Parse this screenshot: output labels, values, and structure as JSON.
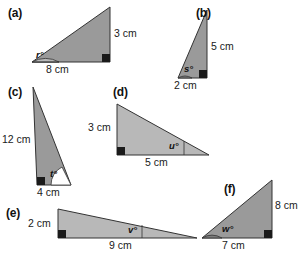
{
  "colors": {
    "triangle_fill": "#9a9a9a",
    "triangle_fill_light": "#b8b8b8",
    "triangle_stroke": "#333333",
    "angle_arc_fill": "#ffffff",
    "angle_arc_fill_dark": "#7d7d7d",
    "right_angle_marker": "#1a1a1a",
    "text": "#1a1a1a",
    "background": "#ffffff"
  },
  "figure": {
    "type": "geometry-diagram",
    "panels": [
      {
        "id": "a",
        "letter": "(a)",
        "unknown_angle": "r°",
        "sides": [
          {
            "label": "3 cm",
            "value": 3,
            "unit": "cm",
            "position": "right"
          },
          {
            "label": "8 cm",
            "value": 8,
            "unit": "cm",
            "position": "bottom"
          }
        ],
        "right_angle_corner": "bottom-right",
        "unknown_angle_corner": "bottom-left"
      },
      {
        "id": "b",
        "letter": "(b)",
        "unknown_angle": "s°",
        "sides": [
          {
            "label": "5 cm",
            "value": 5,
            "unit": "cm",
            "position": "right"
          },
          {
            "label": "2 cm",
            "value": 2,
            "unit": "cm",
            "position": "bottom"
          }
        ],
        "right_angle_corner": "bottom-right",
        "unknown_angle_corner": "bottom-left"
      },
      {
        "id": "c",
        "letter": "(c)",
        "unknown_angle": "t°",
        "sides": [
          {
            "label": "12 cm",
            "value": 12,
            "unit": "cm",
            "position": "left"
          },
          {
            "label": "4 cm",
            "value": 4,
            "unit": "cm",
            "position": "bottom"
          }
        ],
        "right_angle_corner": "bottom-left",
        "unknown_angle_corner": "bottom-right"
      },
      {
        "id": "d",
        "letter": "(d)",
        "unknown_angle": "u°",
        "sides": [
          {
            "label": "3 cm",
            "value": 3,
            "unit": "cm",
            "position": "left"
          },
          {
            "label": "5 cm",
            "value": 5,
            "unit": "cm",
            "position": "bottom"
          }
        ],
        "right_angle_corner": "bottom-left",
        "unknown_angle_corner": "bottom-right"
      },
      {
        "id": "e",
        "letter": "(e)",
        "unknown_angle": "v°",
        "sides": [
          {
            "label": "2 cm",
            "value": 2,
            "unit": "cm",
            "position": "left"
          },
          {
            "label": "9 cm",
            "value": 9,
            "unit": "cm",
            "position": "bottom"
          }
        ],
        "right_angle_corner": "bottom-left",
        "unknown_angle_corner": "bottom-right"
      },
      {
        "id": "f",
        "letter": "(f)",
        "unknown_angle": "w°",
        "sides": [
          {
            "label": "8 cm",
            "value": 8,
            "unit": "cm",
            "position": "right"
          },
          {
            "label": "7 cm",
            "value": 7,
            "unit": "cm",
            "position": "bottom"
          }
        ],
        "right_angle_corner": "bottom-right",
        "unknown_angle_corner": "bottom-left"
      }
    ]
  }
}
